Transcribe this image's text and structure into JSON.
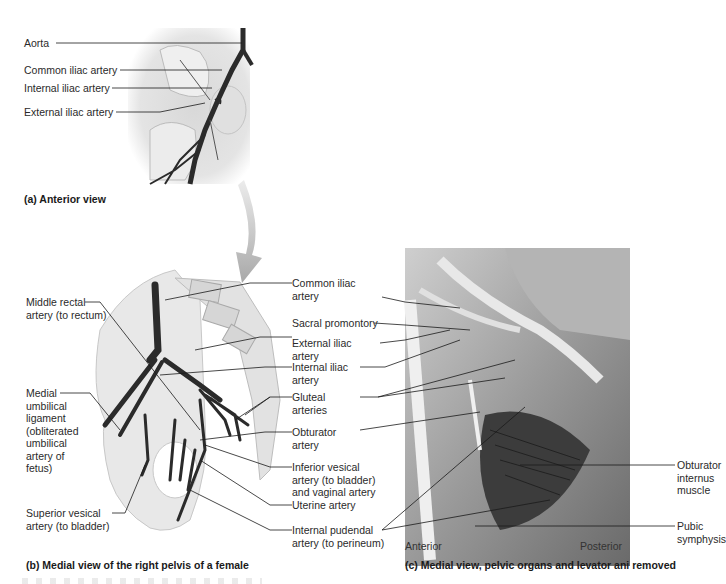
{
  "panel_a": {
    "caption": "(a) Anterior view",
    "labels": {
      "aorta": "Aorta",
      "common_iliac": "Common iliac artery",
      "internal_iliac": "Internal iliac artery",
      "external_iliac": "External iliac artery"
    }
  },
  "panel_b": {
    "caption": "(b) Medial view of the right pelvis of a female",
    "labels_left": {
      "middle_rectal": [
        "Middle rectal",
        "artery (to rectum)"
      ],
      "medial_umbilical": [
        "Medial",
        "umbilical",
        "ligament",
        "(obliterated",
        "umbilical",
        "artery of",
        "fetus)"
      ],
      "superior_vesical": [
        "Superior vesical",
        "artery (to bladder)"
      ]
    },
    "labels_right": {
      "common_iliac": [
        "Common iliac",
        "artery"
      ],
      "sacral_promontory": [
        "Sacral promontory"
      ],
      "external_iliac": [
        "External iliac",
        "artery"
      ],
      "internal_iliac": [
        "Internal iliac",
        "artery"
      ],
      "gluteal": [
        "Gluteal",
        "arteries"
      ],
      "obturator": [
        "Obturator",
        "artery"
      ],
      "inferior_vesical": [
        "Inferior vesical",
        "artery (to bladder)",
        "and vaginal artery"
      ],
      "uterine": [
        "Uterine artery"
      ],
      "internal_pudendal": [
        "Internal pudendal",
        "artery (to perineum)"
      ]
    }
  },
  "panel_c": {
    "caption": "(c) Medial view, pelvic organs and levator ani removed",
    "orientation": {
      "left": "Anterior",
      "right": "Posterior"
    },
    "labels": {
      "obturator_internus": [
        "Obturator",
        "internus",
        "muscle"
      ],
      "pubic_symphysis": [
        "Pubic",
        "symphysis"
      ]
    }
  },
  "colors": {
    "artery": "#2b2b2b",
    "bone": "#e6e6e6",
    "arrow": "#b8b8b8",
    "leader_line": "#1a1a1a"
  }
}
